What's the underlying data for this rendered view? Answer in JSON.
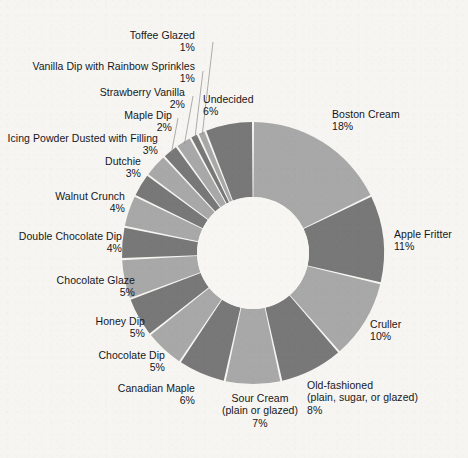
{
  "chart_data": {
    "type": "pie",
    "variant": "donut",
    "title": "",
    "subtitle": "",
    "xlabel": "",
    "ylabel": "",
    "legend_position": "none",
    "grid": false,
    "value_unit": "%",
    "start_angle_deg": 0,
    "direction": "clockwise",
    "colors": {
      "slice_light": "#a8a8a8",
      "slice_dark": "#787878",
      "background": "#f6f5f2",
      "hole": "#f7f6f3",
      "text": "#17171a",
      "leader_line": "#8d8d8d"
    },
    "categories": [
      "Boston Cream",
      "Apple Fritter",
      "Cruller",
      "Old-fashioned (plain, sugar, or glazed)",
      "Sour Cream (plain or glazed)",
      "Canadian Maple",
      "Chocolate Dip",
      "Honey Dip",
      "Chocolate Glaze",
      "Double Chocolate Dip",
      "Walnut Crunch",
      "Dutchie",
      "Icing Powder Dusted with Filling",
      "Maple Dip",
      "Strawberry Vanilla",
      "Vanilla Dip with Rainbow Sprinkles",
      "Toffee Glazed",
      "Undecided"
    ],
    "values": [
      18,
      11,
      10,
      8,
      7,
      6,
      5,
      5,
      5,
      4,
      4,
      3,
      3,
      2,
      2,
      1,
      1,
      6
    ]
  },
  "labels": {
    "boston_cream": {
      "name": "Boston Cream",
      "pct": "18%"
    },
    "apple_fritter": {
      "name": "Apple Fritter",
      "pct": "11%"
    },
    "cruller": {
      "name": "Cruller",
      "pct": "10%"
    },
    "old_fashioned": {
      "name": "Old-fashioned",
      "sub": "(plain, sugar, or glazed)",
      "pct": "8%"
    },
    "sour_cream": {
      "name": "Sour Cream",
      "sub": "(plain or glazed)",
      "pct": "7%"
    },
    "canadian_maple": {
      "name": "Canadian Maple",
      "pct": "6%"
    },
    "chocolate_dip": {
      "name": "Chocolate Dip",
      "pct": "5%"
    },
    "honey_dip": {
      "name": "Honey Dip",
      "pct": "5%"
    },
    "chocolate_glaze": {
      "name": "Chocolate Glaze",
      "pct": "5%"
    },
    "double_choc_dip": {
      "name": "Double Chocolate Dip",
      "pct": "4%"
    },
    "walnut_crunch": {
      "name": "Walnut Crunch",
      "pct": "4%"
    },
    "dutchie": {
      "name": "Dutchie",
      "pct": "3%"
    },
    "icing_powder": {
      "name": "Icing Powder Dusted with Filling",
      "pct": "3%"
    },
    "maple_dip": {
      "name": "Maple Dip",
      "pct": "2%"
    },
    "strawberry_vanilla": {
      "name": "Strawberry Vanilla",
      "pct": "2%"
    },
    "vanilla_sprinkles": {
      "name": "Vanilla Dip with Rainbow Sprinkles",
      "pct": "1%"
    },
    "toffee_glazed": {
      "name": "Toffee Glazed",
      "pct": "1%"
    },
    "undecided": {
      "name": "Undecided",
      "pct": "6%"
    }
  }
}
